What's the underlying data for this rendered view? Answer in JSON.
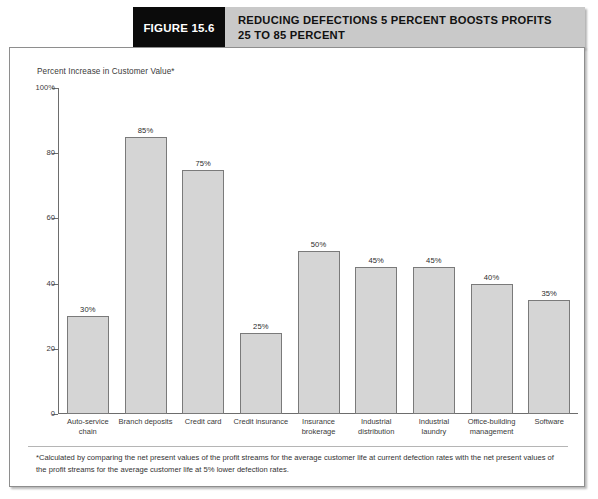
{
  "header": {
    "figure_tag": "FIGURE 15.6",
    "title_line_1": "REDUCING DEFECTIONS 5 PERCENT BOOSTS PROFITS",
    "title_line_2": "25 TO 85 PERCENT",
    "tag_background": "#0b0b0b",
    "title_background": "#c9c9c9"
  },
  "axis_title": "Percent Increase in Customer Value*",
  "footnote": "*Calculated by comparing the net present values of the profit streams for the average customer life at current defection rates with the net present values of the profit streams for the average customer life at 5% lower defection rates.",
  "chart_data": {
    "type": "bar",
    "title": "REDUCING DEFECTIONS 5 PERCENT BOOSTS PROFITS 25 TO 85 PERCENT",
    "xlabel": "",
    "ylabel": "Percent Increase in Customer Value*",
    "ylim": [
      0,
      100
    ],
    "yticks": [
      0,
      20,
      40,
      60,
      80,
      100
    ],
    "ytick_labels": [
      "0",
      "20",
      "40",
      "60",
      "80",
      "100%"
    ],
    "grid": false,
    "legend": "none",
    "bar_color": "#d5d5d5",
    "bar_edge_color": "#7a7a7a",
    "categories": [
      "Auto-service chain",
      "Branch deposits",
      "Credit card",
      "Credit insurance",
      "Insurance brokerage",
      "Industrial distribution",
      "Industrial laundry",
      "Office-building management",
      "Software"
    ],
    "category_lines": [
      [
        "Auto-service",
        "chain"
      ],
      [
        "Branch deposits",
        ""
      ],
      [
        "Credit card",
        ""
      ],
      [
        "Credit insurance",
        ""
      ],
      [
        "Insurance",
        "brokerage"
      ],
      [
        "Industrial",
        "distribution"
      ],
      [
        "Industrial",
        "laundry"
      ],
      [
        "Office-building",
        "management"
      ],
      [
        "Software",
        ""
      ]
    ],
    "values": [
      30,
      85,
      75,
      25,
      50,
      45,
      45,
      40,
      35
    ],
    "value_labels": [
      "30%",
      "85%",
      "75%",
      "25%",
      "50%",
      "45%",
      "45%",
      "40%",
      "35%"
    ]
  }
}
